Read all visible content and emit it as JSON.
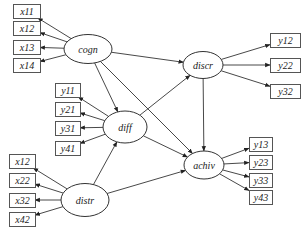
{
  "diagram": {
    "type": "structural-equation-model",
    "latent_variables": [
      {
        "id": "cogn",
        "label": "cogn",
        "cx": 88,
        "cy": 49,
        "rx": 24,
        "ry": 14.5
      },
      {
        "id": "discr",
        "label": "discr",
        "cx": 203,
        "cy": 65,
        "rx": 20,
        "ry": 13.5
      },
      {
        "id": "diff",
        "label": "diff",
        "cx": 125,
        "cy": 127,
        "rx": 22,
        "ry": 16
      },
      {
        "id": "distr",
        "label": "distr",
        "cx": 85,
        "cy": 200,
        "rx": 24,
        "ry": 16.5
      },
      {
        "id": "achiv",
        "label": "achiv",
        "cx": 204,
        "cy": 165,
        "rx": 20,
        "ry": 14
      }
    ],
    "indicators": [
      {
        "label": "x11",
        "latent": "cogn",
        "x": 13,
        "y": 4,
        "w": 27,
        "h": 14
      },
      {
        "label": "x12",
        "latent": "cogn",
        "x": 13,
        "y": 21,
        "w": 27,
        "h": 14
      },
      {
        "label": "x13",
        "latent": "cogn",
        "x": 13,
        "y": 40,
        "w": 27,
        "h": 14
      },
      {
        "label": "x14",
        "latent": "cogn",
        "x": 13,
        "y": 58,
        "w": 27,
        "h": 14
      },
      {
        "label": "y12",
        "latent": "discr",
        "x": 270,
        "y": 33,
        "w": 30,
        "h": 14
      },
      {
        "label": "y22",
        "latent": "discr",
        "x": 270,
        "y": 58,
        "w": 30,
        "h": 14
      },
      {
        "label": "y32",
        "latent": "discr",
        "x": 270,
        "y": 84,
        "w": 30,
        "h": 14
      },
      {
        "label": "y11",
        "latent": "diff",
        "x": 55,
        "y": 83,
        "w": 25,
        "h": 14
      },
      {
        "label": "y21",
        "latent": "diff",
        "x": 55,
        "y": 102,
        "w": 25,
        "h": 14
      },
      {
        "label": "y31",
        "latent": "diff",
        "x": 55,
        "y": 121,
        "w": 25,
        "h": 14
      },
      {
        "label": "y41",
        "latent": "diff",
        "x": 55,
        "y": 141,
        "w": 25,
        "h": 14
      },
      {
        "label": "x12",
        "latent": "distr",
        "x": 9,
        "y": 154,
        "w": 26,
        "h": 14
      },
      {
        "label": "x22",
        "latent": "distr",
        "x": 9,
        "y": 173,
        "w": 26,
        "h": 14
      },
      {
        "label": "x32",
        "latent": "distr",
        "x": 9,
        "y": 193,
        "w": 26,
        "h": 14
      },
      {
        "label": "x42",
        "latent": "distr",
        "x": 9,
        "y": 212,
        "w": 26,
        "h": 14
      },
      {
        "label": "y13",
        "latent": "achiv",
        "x": 249,
        "y": 137,
        "w": 23,
        "h": 14
      },
      {
        "label": "y23",
        "latent": "achiv",
        "x": 249,
        "y": 155,
        "w": 23,
        "h": 14
      },
      {
        "label": "y33",
        "latent": "achiv",
        "x": 249,
        "y": 173,
        "w": 23,
        "h": 14
      },
      {
        "label": "y43",
        "latent": "achiv",
        "x": 249,
        "y": 190,
        "w": 23,
        "h": 14
      }
    ],
    "paths": [
      {
        "from": "cogn",
        "to": "discr"
      },
      {
        "from": "cogn",
        "to": "diff"
      },
      {
        "from": "cogn",
        "to": "achiv"
      },
      {
        "from": "diff",
        "to": "discr"
      },
      {
        "from": "diff",
        "to": "achiv"
      },
      {
        "from": "discr",
        "to": "achiv"
      },
      {
        "from": "distr",
        "to": "diff"
      },
      {
        "from": "distr",
        "to": "achiv"
      }
    ]
  }
}
